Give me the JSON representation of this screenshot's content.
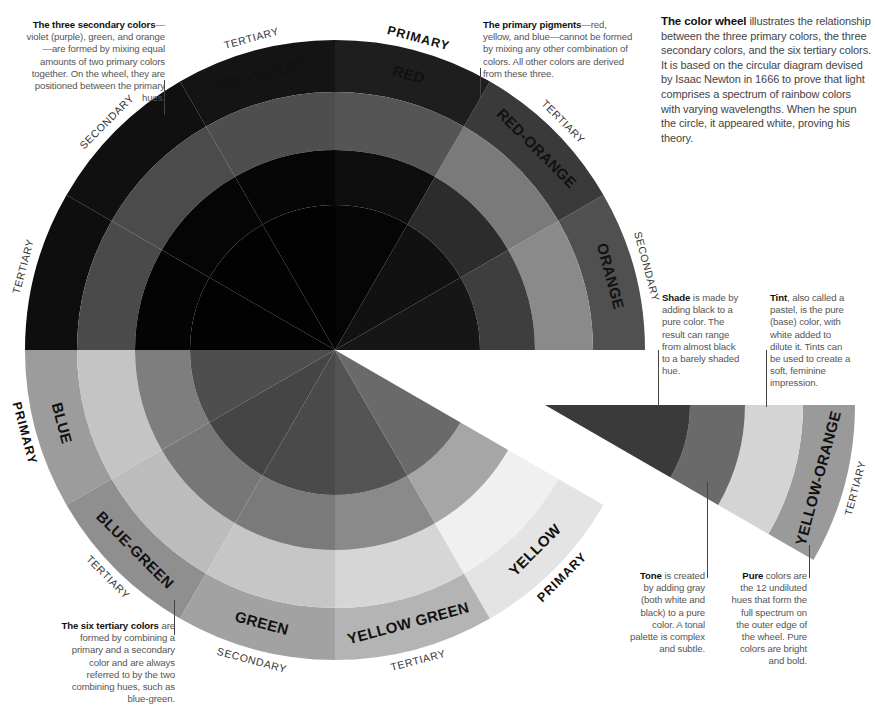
{
  "intro": {
    "bold": "The color wheel",
    "text": " illustrates the relationship between the three primary colors, the three secondary colors, and the six tertiary colors. It is based on the circular diagram devised by Isaac Newton in 1666 to prove that light comprises a spectrum of rainbow colors with varying wavelengths. When he spun the circle, it appeared white, proving his theory."
  },
  "notes": {
    "secondary": {
      "bold": "The three secondary colors",
      "text": "—violet (purple), green, and orange—are formed by mixing equal amounts of two primary colors together. On the wheel, they are positioned between the primary hues."
    },
    "primary": {
      "bold": "The primary pigments",
      "text": "—red, yellow, and blue—cannot be formed by mixing any other combination of colors. All other colors are derived from these three."
    },
    "tertiary": {
      "bold": "The six tertiary colors",
      "text": " are formed by combining a primary and a secondary color and are always referred to by the two combining hues, such as blue-green."
    },
    "shade": {
      "bold": "Shade",
      "text": " is made by adding black to a pure color. The result can range from almost black to a barely shaded hue."
    },
    "tint": {
      "bold": "Tint",
      "text": ", also called a pastel, is the pure (base) color, with white added to dilute it. Tints can be used to create a soft, feminine impression."
    },
    "tone": {
      "bold": "Tone",
      "text": " is created by adding gray (both white and black) to a pure color. A tonal palette is complex and subtle."
    },
    "pure": {
      "bold": "Pure",
      "text": " colors are the 12 undiluted hues that form the full spectrum on the outer edge of the wheel. Pure colors are bright and bold."
    }
  },
  "wheel": {
    "segments": [
      {
        "name": "ORANGE",
        "category": "SECONDARY",
        "category_style": "light",
        "angle": 345,
        "colors": [
          "#505050",
          "#8a8a8a",
          "#3e3e3e",
          "#161616"
        ]
      },
      {
        "name": "RED-ORANGE",
        "category": "TERTIARY",
        "category_style": "light",
        "angle": 315,
        "colors": [
          "#3a3a3a",
          "#7a7a7a",
          "#2c2c2c",
          "#111111"
        ]
      },
      {
        "name": "RED",
        "category": "PRIMARY",
        "category_style": "bold",
        "angle": 285,
        "colors": [
          "#1e1e1e",
          "#555555",
          "#0e0e0e",
          "#050505"
        ]
      },
      {
        "name": "RED-VIOLET",
        "category": "TERTIARY",
        "category_style": "light",
        "angle": 255,
        "colors": [
          "#141414",
          "#4e4e4e",
          "#060606",
          "#020202"
        ]
      },
      {
        "name": "VIOLET",
        "category": "SECONDARY",
        "category_style": "light",
        "angle": 225,
        "colors": [
          "#101010",
          "#4b4b4b",
          "#050505",
          "#020202"
        ]
      },
      {
        "name": "",
        "category": "TERTIARY",
        "category_style": "light",
        "angle": 195,
        "colors": [
          "#0e0e0e",
          "#4a4a4a",
          "#040404",
          "#020202"
        ]
      },
      {
        "name": "BLUE",
        "category": "PRIMARY",
        "category_style": "bold",
        "angle": 165,
        "colors": [
          "#9c9c9c",
          "#c4c4c4",
          "#7e7e7e",
          "#4e4e4e"
        ]
      },
      {
        "name": "BLUE-GREEN",
        "category": "TERTIARY",
        "category_style": "light",
        "angle": 135,
        "colors": [
          "#8f8f8f",
          "#bcbcbc",
          "#777777",
          "#454545"
        ]
      },
      {
        "name": "GREEN",
        "category": "SECONDARY",
        "category_style": "bold-dark",
        "angle": 105,
        "colors": [
          "#a2a2a2",
          "#c6c6c6",
          "#7a7a7a",
          "#4a4a4a"
        ]
      },
      {
        "name": "YELLOW GREEN",
        "category": "TERTIARY",
        "category_style": "light",
        "angle": 75,
        "colors": [
          "#b4b4b4",
          "#d6d6d6",
          "#8a8a8a",
          "#545454"
        ]
      },
      {
        "name": "YELLOW",
        "category": "PRIMARY",
        "category_style": "bold",
        "angle": 45,
        "colors": [
          "#e4e4e4",
          "#f0f0f0",
          "#a6a6a6",
          "#6a6a6a"
        ]
      },
      {
        "name": "YELLOW-ORANGE",
        "category": "TERTIARY",
        "category_style": "light",
        "angle": 15,
        "colors": [
          "#9a9a9a",
          "#d4d4d4",
          "#6a6a6a",
          "#3a3a3a"
        ],
        "detached": true
      }
    ],
    "ring_names": [
      "Pure",
      "Tint",
      "Tone",
      "Shade"
    ]
  }
}
